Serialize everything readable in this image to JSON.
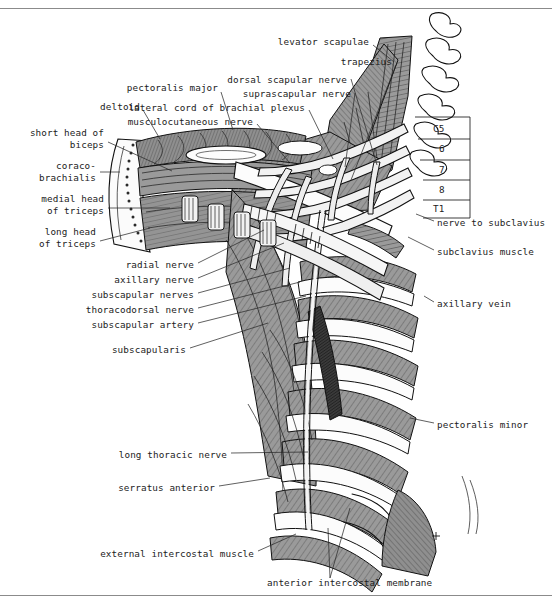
{
  "figure": {
    "orientation": "anterior view, right side",
    "style": "line drawing with grey wash and hatching",
    "frame": {
      "top_rule": true,
      "bottom_rule": true,
      "rule_color": "#8b8b8b"
    },
    "palette": {
      "background": "#ffffff",
      "ink": "#111111",
      "muscle_grey": "#9a9a9a",
      "muscle_grey_dark": "#7d7d7d",
      "bone_white": "#fbfbfb",
      "nerve_pale": "#efefef",
      "vessel_dark": "#3a3a3a",
      "label_text": "#1c1c1c"
    }
  },
  "labels": {
    "left_column": [
      {
        "id": "pectoralis-major",
        "text": "pectoralis major",
        "x": 218,
        "y": 88,
        "align": "right"
      },
      {
        "id": "deltoid",
        "text": "deltoid",
        "x": 140,
        "y": 107,
        "align": "right"
      },
      {
        "id": "short-head-of-biceps",
        "text": "short head of\nbiceps",
        "x": 104,
        "y": 133,
        "align": "right"
      },
      {
        "id": "coracobrachialis",
        "text": "coraco-\nbrachialis",
        "x": 96,
        "y": 166,
        "align": "right"
      },
      {
        "id": "medial-head-of-triceps",
        "text": "medial head\nof triceps",
        "x": 104,
        "y": 199,
        "align": "right"
      },
      {
        "id": "long-head-of-triceps",
        "text": "long head\nof triceps",
        "x": 96,
        "y": 232,
        "align": "right"
      },
      {
        "id": "radial-nerve",
        "text": "radial nerve",
        "x": 194,
        "y": 265,
        "align": "right"
      },
      {
        "id": "axillary-nerve",
        "text": "axillary nerve",
        "x": 194,
        "y": 280,
        "align": "right"
      },
      {
        "id": "subscapular-nerves",
        "text": "subscapular nerves",
        "x": 194,
        "y": 295,
        "align": "right"
      },
      {
        "id": "thoracodorsal-nerve",
        "text": "thoracodorsal nerve",
        "x": 194,
        "y": 310,
        "align": "right"
      },
      {
        "id": "subscapular-artery",
        "text": "subscapular artery",
        "x": 194,
        "y": 325,
        "align": "right"
      },
      {
        "id": "subscapularis",
        "text": "subscapularis",
        "x": 186,
        "y": 350,
        "align": "right"
      },
      {
        "id": "long-thoracic-nerve",
        "text": "long thoracic nerve",
        "x": 227,
        "y": 455,
        "align": "right"
      },
      {
        "id": "serratus-anterior",
        "text": "serratus anterior",
        "x": 215,
        "y": 488,
        "align": "right"
      },
      {
        "id": "external-intercostal-muscle",
        "text": "external intercostal muscle",
        "x": 254,
        "y": 554,
        "align": "right"
      }
    ],
    "top_column": [
      {
        "id": "levator-scapulae",
        "text": "levator scapulae",
        "x": 369,
        "y": 42,
        "align": "right"
      },
      {
        "id": "trapezius",
        "text": "trapezius",
        "x": 392,
        "y": 62,
        "align": "right"
      },
      {
        "id": "dorsal-scapular-nerve",
        "text": "dorsal scapular nerve",
        "x": 347,
        "y": 80,
        "align": "right"
      },
      {
        "id": "suprascapular-nerve",
        "text": "suprascapular nerve",
        "x": 351,
        "y": 94,
        "align": "right"
      },
      {
        "id": "lateral-cord-of-brachial-plexus",
        "text": "lateral cord of brachial plexus",
        "x": 305,
        "y": 108,
        "align": "right"
      },
      {
        "id": "musculocutaneous-nerve",
        "text": "musculocutaneous nerve",
        "x": 253,
        "y": 122,
        "align": "right"
      }
    ],
    "right_column": [
      {
        "id": "nerve-to-subclavius",
        "text": "nerve to subclavius",
        "x": 437,
        "y": 223,
        "align": "left"
      },
      {
        "id": "subclavius-muscle",
        "text": "subclavius muscle",
        "x": 437,
        "y": 252,
        "align": "left"
      },
      {
        "id": "axillary-vein",
        "text": "axillary vein",
        "x": 437,
        "y": 304,
        "align": "left"
      },
      {
        "id": "pectoralis-minor",
        "text": "pectoralis minor",
        "x": 437,
        "y": 425,
        "align": "left"
      }
    ],
    "bottom_column": [
      {
        "id": "anterior-intercostal-membrane",
        "text": "anterior intercostal membrane",
        "x": 267,
        "y": 583,
        "align": "left"
      }
    ],
    "spinal_roots": [
      {
        "id": "root-c5",
        "text": "C5",
        "x": 433,
        "y": 129
      },
      {
        "id": "root-c6",
        "text": "6",
        "x": 439,
        "y": 149
      },
      {
        "id": "root-c7",
        "text": "7",
        "x": 439,
        "y": 170
      },
      {
        "id": "root-c8",
        "text": "8",
        "x": 439,
        "y": 190
      },
      {
        "id": "root-t1",
        "text": "T1",
        "x": 433,
        "y": 209
      }
    ]
  },
  "leader_lines": [
    {
      "from": "pectoralis-major",
      "path": "M221,92 L233,130"
    },
    {
      "from": "deltoid",
      "path": "M143,110 L160,139"
    },
    {
      "from": "short-head-of-biceps",
      "path": "M108,142 L172,171"
    },
    {
      "from": "coracobrachialis",
      "path": "M100,172 L120,172"
    },
    {
      "from": "medial-head-of-triceps",
      "path": "M108,208 L170,208"
    },
    {
      "from": "long-head-of-triceps",
      "path": "M100,241 L150,228"
    },
    {
      "from": "radial-nerve",
      "path": "M198,263 L264,230"
    },
    {
      "from": "axillary-nerve",
      "path": "M198,278 L284,243"
    },
    {
      "from": "subscapular-nerves",
      "path": "M198,293 L290,268"
    },
    {
      "from": "thoracodorsal-nerve",
      "path": "M198,308 L300,282"
    },
    {
      "from": "subscapular-artery",
      "path": "M198,323 L306,296"
    },
    {
      "from": "subscapularis",
      "path": "M190,348 L268,323"
    },
    {
      "from": "long-thoracic-nerve",
      "path": "M231,453 L308,452"
    },
    {
      "from": "serratus-anterior",
      "path": "M219,486 L270,478"
    },
    {
      "from": "external-intercostal-muscle",
      "path": "M258,551 L296,534"
    },
    {
      "from": "levator-scapulae",
      "path": "M373,45 L394,62"
    },
    {
      "from": "trapezius",
      "path": "M396,65 L351,180"
    },
    {
      "from": "dorsal-scapular-nerve",
      "path": "M351,79 L377,165"
    },
    {
      "from": "suprascapular-nerve",
      "path": "M355,93 L345,167"
    },
    {
      "from": "lateral-cord-of-brachial-plexus",
      "path": "M309,110 L333,159"
    },
    {
      "from": "musculocutaneous-nerve",
      "path": "M257,124 L289,162"
    },
    {
      "from": "nerve-to-subclavius",
      "path": "M434,221 L416,214"
    },
    {
      "from": "subclavius-muscle",
      "path": "M434,250 L408,237"
    },
    {
      "from": "axillary-vein",
      "path": "M434,302 L424,296"
    },
    {
      "from": "pectoralis-minor",
      "path": "M434,423 L410,418"
    },
    {
      "from": "anterior-intercostal-membrane",
      "path": "M330,578 L328,528 M330,578 L350,508"
    }
  ]
}
